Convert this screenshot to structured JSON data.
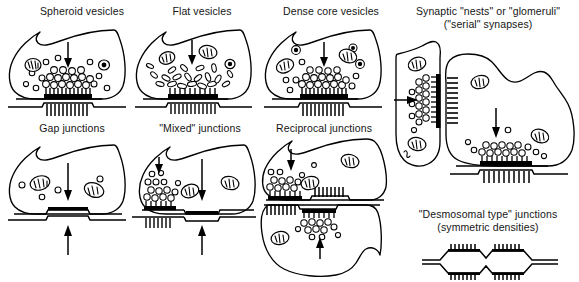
{
  "figure": {
    "title_row_1": [
      "Spheroid vesicles",
      "Flat vesicles",
      "Dense core vesicles"
    ],
    "title_row_2": [
      "Gap junctions",
      "\"Mixed\" junctions",
      "Reciprocal junctions"
    ],
    "right_top_title_line1": "Synaptic \"nests\" or \"glomeruli\"",
    "right_top_title_line2": "(\"serial\" synapses)",
    "right_bottom_title_line1": "\"Desmosomal type\" junctions",
    "right_bottom_title_line2": "(symmetric densities)",
    "ink_color": "#000000",
    "background_color": "#ffffff"
  },
  "panels": [
    {
      "id": "spheroid-vesicles",
      "label": "Spheroid vesicles",
      "vesicle_shape": "round",
      "vesicle_count": 26,
      "mitochondria_count": 2,
      "arrow_direction": "down",
      "arrow_count": 1,
      "junction_type": "chemical-asymmetric",
      "postsynaptic_density": "hatched"
    },
    {
      "id": "flat-vesicles",
      "label": "Flat vesicles",
      "vesicle_shape": "flattened-oval",
      "vesicle_count": 22,
      "mitochondria_count": 3,
      "arrow_direction": "down",
      "arrow_count": 1,
      "junction_type": "chemical-symmetric",
      "postsynaptic_density": "hatched"
    },
    {
      "id": "dense-core-vesicles",
      "label": "Dense core vesicles",
      "vesicle_shape": "round-with-dark-core",
      "vesicle_count": 27,
      "mitochondria_count": 2,
      "arrow_direction": "down",
      "arrow_count": 1,
      "junction_type": "chemical-asymmetric",
      "postsynaptic_density": "hatched"
    },
    {
      "id": "gap-junctions",
      "label": "Gap junctions",
      "vesicle_shape": "none",
      "vesicle_count": 4,
      "mitochondria_count": 2,
      "arrow_direction": "bidirectional",
      "arrow_count": 2,
      "junction_type": "electrical-gap",
      "postsynaptic_density": "none"
    },
    {
      "id": "mixed-junctions",
      "label": "\"Mixed\" junctions",
      "vesicle_shape": "round",
      "vesicle_count": 14,
      "mitochondria_count": 2,
      "arrow_direction": "down-and-bidirectional",
      "arrow_count": 3,
      "junction_type": "chemical-plus-gap",
      "postsynaptic_density": "hatched"
    },
    {
      "id": "reciprocal-junctions",
      "label": "Reciprocal junctions",
      "vesicle_shape": "round",
      "vesicle_count": 24,
      "mitochondria_count": 3,
      "arrow_direction": "down-and-up",
      "arrow_count": 2,
      "junction_type": "reciprocal-paired",
      "postsynaptic_density": "hatched-both-sides"
    },
    {
      "id": "synaptic-nests",
      "label": "Synaptic \"nests\" or \"glomeruli\" (\"serial\" synapses)",
      "vesicle_shape": "round",
      "mitochondria_count": 4,
      "arrow_direction": "right-then-down",
      "arrow_count": 2,
      "junction_type": "serial-glomerulus",
      "postsynaptic_density": "hatched"
    },
    {
      "id": "desmosomal-junctions",
      "label": "\"Desmosomal type\" junctions (symmetric densities)",
      "vesicle_shape": "none",
      "mitochondria_count": 0,
      "arrow_count": 0,
      "junction_type": "desmosomal-symmetric",
      "postsynaptic_density": "symmetric-hatched-both-membranes"
    }
  ]
}
